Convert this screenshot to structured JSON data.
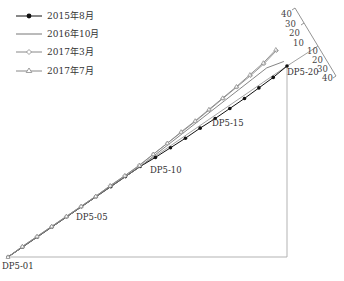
{
  "legend": {
    "items": [
      {
        "label": "2015年8月",
        "marker": "filled-circle",
        "color": "#111111"
      },
      {
        "label": "2016年10月",
        "marker": "none",
        "color": "#777777"
      },
      {
        "label": "2017年3月",
        "marker": "open-diamond",
        "color": "#888888"
      },
      {
        "label": "2017年7月",
        "marker": "open-triangle",
        "color": "#888888"
      }
    ]
  },
  "points": {
    "start": "DP5-01",
    "p05": "DP5-05",
    "p10": "DP5-10",
    "p15": "DP5-15",
    "end": "DP5-20"
  },
  "scale": {
    "upper": [
      "40",
      "30",
      "20",
      "10"
    ],
    "lower": [
      "10",
      "20",
      "30",
      "40"
    ]
  },
  "chart_data": {
    "type": "line",
    "title": "",
    "xlabel": "",
    "ylabel": "",
    "categories": [
      "DP5-01",
      "DP5-02",
      "DP5-03",
      "DP5-04",
      "DP5-05",
      "DP5-06",
      "DP5-07",
      "DP5-08",
      "DP5-09",
      "DP5-10",
      "DP5-11",
      "DP5-12",
      "DP5-13",
      "DP5-14",
      "DP5-15",
      "DP5-16",
      "DP5-17",
      "DP5-18",
      "DP5-19",
      "DP5-20"
    ],
    "series": [
      {
        "name": "2015年8月",
        "values": [
          0,
          0,
          0,
          0,
          0,
          0,
          0,
          0,
          0,
          0,
          2,
          3,
          4,
          4,
          5,
          5,
          5,
          4,
          3,
          0
        ]
      },
      {
        "name": "2016年10月",
        "values": [
          0,
          0,
          0,
          0,
          0,
          0,
          0,
          0,
          0,
          0,
          -2,
          -4,
          -6,
          -8,
          -10,
          -12,
          -14,
          -16,
          -18,
          -10
        ]
      },
      {
        "name": "2017年3月",
        "values": [
          0,
          -1,
          -1,
          -1,
          -1,
          -1,
          -1,
          -2,
          -2,
          -3,
          -5,
          -7,
          -9,
          -11,
          -14,
          -17,
          -20,
          -23,
          -27,
          -34
        ]
      },
      {
        "name": "2017年7月",
        "values": [
          0,
          -1,
          -1,
          -1,
          -1,
          -1,
          -1,
          -2,
          -2,
          -2,
          -5,
          -7,
          -10,
          -12,
          -15,
          -18,
          -21,
          -25,
          -29,
          -36
        ]
      }
    ],
    "scale_ticks": [
      -40,
      -30,
      -20,
      -10,
      10,
      20,
      30,
      40
    ],
    "grid": false,
    "legend_position": "top-left"
  }
}
